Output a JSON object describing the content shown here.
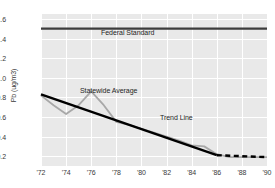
{
  "chart": {
    "title": "",
    "y_axis_label": "Pb (ug/m3)",
    "x_axis_label": "",
    "annotations": {
      "federal_standard": "Federal Standard",
      "statewide_average": "Statewide Average",
      "trend_line": "Trend Line"
    },
    "colors": {
      "plot_background": "#e9e9e9",
      "gridline": "#ffffff",
      "federal_standard_line": "#3d3d3d",
      "statewide_average_line": "#a8a8a8",
      "trend_line": "#000000",
      "tick_text": "#3a3a3a"
    }
  },
  "chart_data": {
    "type": "line",
    "title": "",
    "xlabel": "",
    "ylabel": "Pb (ug/m3)",
    "xlim": [
      1972,
      1990
    ],
    "ylim": [
      0.1,
      1.65
    ],
    "grid": true,
    "legend": "inline-annotations",
    "x_tick_labels": [
      "'72",
      "'74",
      "'76",
      "'78",
      "'80",
      "'82",
      "'84",
      "'86",
      "'88",
      "'90"
    ],
    "x_tick_values": [
      1972,
      1974,
      1976,
      1978,
      1980,
      1982,
      1984,
      1986,
      1988,
      1990
    ],
    "y_tick_labels": [
      "0.2",
      "0.4",
      "0.6",
      "0.8",
      "1.0",
      "1.2",
      "1.4",
      "1.6"
    ],
    "y_tick_values": [
      0.2,
      0.4,
      0.6,
      0.8,
      1.0,
      1.2,
      1.4,
      1.6
    ],
    "series": [
      {
        "name": "Federal Standard",
        "style": "solid",
        "color": "#3d3d3d",
        "width": 2.2,
        "x": [
          1972,
          1990
        ],
        "values": [
          1.5,
          1.5
        ]
      },
      {
        "name": "Statewide Average",
        "style": "solid",
        "color": "#a8a8a8",
        "width": 1.8,
        "x": [
          1972,
          1973,
          1974,
          1975,
          1976,
          1977,
          1978,
          1979,
          1980,
          1981,
          1982,
          1983,
          1984,
          1985,
          1986,
          1987,
          1988,
          1989,
          1990
        ],
        "values": [
          0.82,
          0.72,
          0.63,
          0.72,
          0.86,
          0.72,
          0.55,
          0.52,
          0.48,
          0.44,
          0.4,
          0.36,
          0.31,
          0.3,
          0.22,
          0.19,
          0.19,
          0.19,
          0.19
        ]
      },
      {
        "name": "Trend Line",
        "style": "solid-then-dashed",
        "dash_starts_at": 1986,
        "color": "#000000",
        "width": 2.4,
        "x": [
          1972,
          1986,
          1990
        ],
        "values": [
          0.83,
          0.21,
          0.19
        ]
      }
    ]
  }
}
